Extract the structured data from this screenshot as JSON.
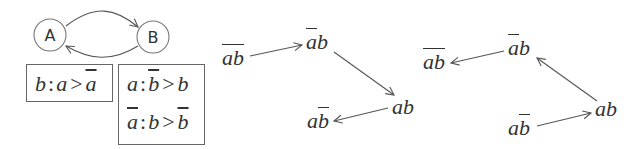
{
  "game_graph": {
    "nodes": [
      {
        "id": "A",
        "label": "A"
      },
      {
        "id": "B",
        "label": "B"
      }
    ],
    "edges": [
      {
        "from": "A",
        "to": "B"
      },
      {
        "from": "B",
        "to": "A"
      }
    ]
  },
  "preferences": {
    "box1": {
      "rules": [
        {
          "player": "b",
          "colon": ":",
          "left": "a",
          "gt": ">",
          "right": "a",
          "right_negated": true
        }
      ]
    },
    "box2": {
      "rules": [
        {
          "player": "a",
          "player_negated": false,
          "colon": ":",
          "left": "b",
          "left_negated": true,
          "gt": ">",
          "right": "b",
          "right_negated": false
        },
        {
          "player": "a",
          "player_negated": true,
          "colon": ":",
          "left": "b",
          "left_negated": false,
          "gt": ">",
          "right": "b",
          "right_negated": true
        }
      ]
    }
  },
  "state_graphs": [
    {
      "name": "middle",
      "states": [
        {
          "id": "nanb",
          "a": "a",
          "b": "b",
          "a_neg": true,
          "b_neg": true
        },
        {
          "id": "nab",
          "a": "a",
          "b": "b",
          "a_neg": true,
          "b_neg": false
        },
        {
          "id": "ab",
          "a": "a",
          "b": "b",
          "a_neg": false,
          "b_neg": false
        },
        {
          "id": "anb",
          "a": "a",
          "b": "b",
          "a_neg": false,
          "b_neg": true
        }
      ],
      "edges": [
        {
          "from": "nanb",
          "to": "nab"
        },
        {
          "from": "nab",
          "to": "ab"
        },
        {
          "from": "ab",
          "to": "anb"
        }
      ]
    },
    {
      "name": "right",
      "states": [
        {
          "id": "nanb",
          "a": "a",
          "b": "b",
          "a_neg": true,
          "b_neg": true
        },
        {
          "id": "nab",
          "a": "a",
          "b": "b",
          "a_neg": true,
          "b_neg": false
        },
        {
          "id": "ab",
          "a": "a",
          "b": "b",
          "a_neg": false,
          "b_neg": false
        },
        {
          "id": "anb",
          "a": "a",
          "b": "b",
          "a_neg": false,
          "b_neg": true
        }
      ],
      "edges": [
        {
          "from": "nab",
          "to": "nanb"
        },
        {
          "from": "ab",
          "to": "nab"
        },
        {
          "from": "anb",
          "to": "ab"
        }
      ]
    }
  ],
  "colors": {
    "stroke": "#555555",
    "text": "#333333",
    "background": "#ffffff"
  }
}
